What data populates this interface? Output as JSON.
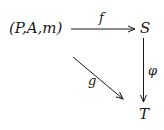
{
  "diagram": {
    "type": "commutative-diagram",
    "nodes": {
      "source": "(P,A,m)",
      "top_right": "S",
      "bottom_right": "T"
    },
    "arrows": {
      "f": {
        "label": "f",
        "from": "(P,A,m)",
        "to": "S"
      },
      "g": {
        "label": "g",
        "from": "(P,A,m)",
        "to": "T"
      },
      "phi": {
        "label": "φ",
        "from": "S",
        "to": "T"
      }
    },
    "colors": {
      "ink": "#1a1a1a",
      "background": "#ffffff"
    }
  }
}
